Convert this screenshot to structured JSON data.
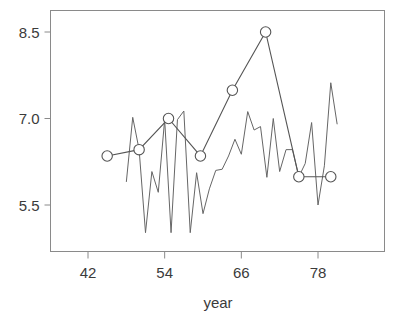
{
  "chart_data": {
    "type": "line",
    "title": "",
    "subtitle": "",
    "xlabel": "year",
    "ylabel": "",
    "xlim": [
      39.5,
      84.0
    ],
    "ylim": [
      4.6,
      8.88
    ],
    "grid": false,
    "legend_position": "none",
    "xticks": [
      42,
      54,
      66,
      78
    ],
    "xticklabels": [
      "42",
      "54",
      "66",
      "78"
    ],
    "yticks": [
      5.5,
      7.0,
      8.5
    ],
    "yticklabels": [
      "5.5",
      "7.0",
      "8.5"
    ],
    "series": [
      {
        "name": "smoothed-series",
        "marker": "open-circle",
        "color": "#555555",
        "points": [
          {
            "x": 45.0,
            "y": 6.35
          },
          {
            "x": 50.0,
            "y": 6.46
          },
          {
            "x": 54.6,
            "y": 7.0
          },
          {
            "x": 59.6,
            "y": 6.35
          },
          {
            "x": 64.6,
            "y": 7.49
          },
          {
            "x": 69.8,
            "y": 8.5
          },
          {
            "x": 75.0,
            "y": 5.99
          },
          {
            "x": 80.0,
            "y": 5.99
          }
        ]
      },
      {
        "name": "annual-series",
        "marker": "none",
        "color": "#666666",
        "points": [
          {
            "x": 48.0,
            "y": 5.9
          },
          {
            "x": 49.0,
            "y": 7.02
          },
          {
            "x": 50.0,
            "y": 6.46
          },
          {
            "x": 51.0,
            "y": 5.02
          },
          {
            "x": 52.0,
            "y": 6.08
          },
          {
            "x": 53.0,
            "y": 5.72
          },
          {
            "x": 54.0,
            "y": 6.98
          },
          {
            "x": 55.0,
            "y": 5.02
          },
          {
            "x": 56.0,
            "y": 6.98
          },
          {
            "x": 57.0,
            "y": 7.13
          },
          {
            "x": 58.0,
            "y": 5.02
          },
          {
            "x": 59.0,
            "y": 6.06
          },
          {
            "x": 60.0,
            "y": 5.35
          },
          {
            "x": 61.0,
            "y": 5.78
          },
          {
            "x": 62.0,
            "y": 6.1
          },
          {
            "x": 63.0,
            "y": 6.12
          },
          {
            "x": 64.0,
            "y": 6.35
          },
          {
            "x": 65.0,
            "y": 6.64
          },
          {
            "x": 66.0,
            "y": 6.38
          },
          {
            "x": 67.0,
            "y": 7.12
          },
          {
            "x": 68.0,
            "y": 6.8
          },
          {
            "x": 69.0,
            "y": 6.86
          },
          {
            "x": 70.0,
            "y": 5.98
          },
          {
            "x": 71.0,
            "y": 7.0
          },
          {
            "x": 72.0,
            "y": 6.08
          },
          {
            "x": 73.0,
            "y": 6.46
          },
          {
            "x": 74.0,
            "y": 6.46
          },
          {
            "x": 75.0,
            "y": 5.99
          },
          {
            "x": 76.0,
            "y": 6.22
          },
          {
            "x": 77.0,
            "y": 6.93
          },
          {
            "x": 78.0,
            "y": 5.5
          },
          {
            "x": 79.0,
            "y": 6.18
          },
          {
            "x": 80.0,
            "y": 7.62
          },
          {
            "x": 81.0,
            "y": 6.9
          }
        ]
      }
    ]
  },
  "axis": {
    "x_title": "year"
  }
}
